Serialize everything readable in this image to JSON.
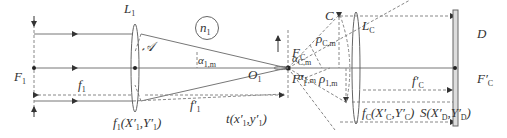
{
  "diagram": {
    "type": "optical-ray-diagram",
    "colors": {
      "line": "#777777",
      "dashed": "#888888",
      "text": "#333333",
      "detector_fill": "#dddddd"
    },
    "labels": {
      "L1": "L",
      "L1_sub": "1",
      "A": "𝒜",
      "n1": "n",
      "n1_sub": "1",
      "F1": "F",
      "F1_sub": "1",
      "f1": "f",
      "f1_sub": "1",
      "f1p": "f′",
      "f1p_sub": "1",
      "alpha1m_top": "α",
      "alpha1m_top_sub": "1,m",
      "FC": "F",
      "FC_sub": "C",
      "O1": "O",
      "O1_sub": "1",
      "F1p": "F′",
      "F1p_sub": "1",
      "alphaCm": "α",
      "alphaCm_sub": "C,m",
      "alpha1m_bot": "α",
      "alpha1m_bot_sub": "1,m",
      "C": "C",
      "rhoCm": "ρ",
      "rhoCm_sub": "C,m",
      "rho1m": "ρ",
      "rho1m_sub": "1,m",
      "LC": "L",
      "LC_sub": "C",
      "fCp": "f′",
      "fCp_sub": "C",
      "D": "D",
      "FCp": "F′",
      "FCp_sub": "C",
      "f1_coords": "f₁(X′₁,Y′₁)",
      "t_coords": "t(x′₁,y′₁)",
      "fC_coords": "f_C(X′_C,Y′_C)",
      "S_coords": "S(X′_D,Y′_D)"
    },
    "bottom_labels": {
      "f1_prefix": "f",
      "f1_sub": "1",
      "f1_rest": "(X′",
      "f1_x_sub": "1",
      "f1_mid": ",Y′",
      "f1_y_sub": "1",
      "f1_end": ")",
      "t_prefix": "t",
      "t_rest": "(x′",
      "t_x_sub": "1",
      "t_mid": ",y′",
      "t_y_sub": "1",
      "t_end": ")",
      "fC_prefix": "f",
      "fC_sub": "C",
      "fC_rest": "(X′",
      "fC_x_sub": "C",
      "fC_mid": ",Y′",
      "fC_y_sub": "C",
      "fC_end": ")",
      "S_prefix": "S",
      "S_rest": "(X′",
      "S_x_sub": "D",
      "S_mid": ",Y′",
      "S_y_sub": "D",
      "S_end": ")"
    }
  }
}
